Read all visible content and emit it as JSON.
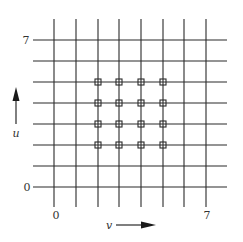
{
  "diagram": {
    "title": "",
    "grid": {
      "vertical_x": [
        54,
        76,
        98,
        119,
        141,
        163,
        184,
        206
      ],
      "horizontal_y": [
        40,
        61,
        82,
        103,
        124,
        145,
        166,
        187
      ],
      "vertical_y_range": [
        19,
        207
      ],
      "horizontal_x_range": [
        33,
        227
      ],
      "line_color": "#2a2a2a"
    },
    "markers": {
      "shape": "square",
      "size": 6,
      "columns": [
        98,
        119,
        141,
        163
      ],
      "rows": [
        82,
        103,
        124,
        145
      ],
      "count": 16
    },
    "u_axis": {
      "label": "u",
      "direction": "up",
      "tick_labels": [
        {
          "text": "7",
          "y": 40
        },
        {
          "text": "0",
          "y": 187
        }
      ]
    },
    "v_axis": {
      "label": "v",
      "direction": "right",
      "tick_labels": [
        {
          "text": "0",
          "x": 54
        },
        {
          "text": "7",
          "x": 206
        }
      ]
    }
  }
}
